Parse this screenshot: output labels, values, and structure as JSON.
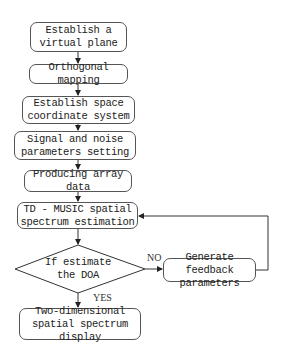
{
  "flowchart": {
    "steps": [
      {
        "id": "s1",
        "label": "Establish a virtual plane"
      },
      {
        "id": "s2",
        "label": "Orthogonal mapping"
      },
      {
        "id": "s3",
        "label": "Establish space coordinate system"
      },
      {
        "id": "s4",
        "label": "Signal and noise parameters setting"
      },
      {
        "id": "s5",
        "label": "Producing array data"
      },
      {
        "id": "s6",
        "label": "TD - MUSIC spatial spectrum estimation"
      }
    ],
    "decision": {
      "label": "If estimate the DOA"
    },
    "feedback": {
      "label": "Generate feedback parameters"
    },
    "final": {
      "label": "Two-dimensional spatial spectrum display"
    },
    "edge_labels": {
      "no": "NO",
      "yes": "YES"
    },
    "colors": {
      "line": "#333333",
      "border": "#555555",
      "text": "#222222"
    }
  }
}
